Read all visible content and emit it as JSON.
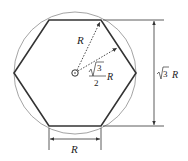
{
  "diagram": {
    "labels": {
      "radius": "R",
      "apothem_num": "3",
      "apothem_den": "2",
      "apothem_var": "R",
      "height_num": "3",
      "height_var": "R",
      "side": "R"
    },
    "colors": {
      "hexagon": "#333333",
      "circle": "#999999",
      "dimension": "#333333"
    }
  }
}
